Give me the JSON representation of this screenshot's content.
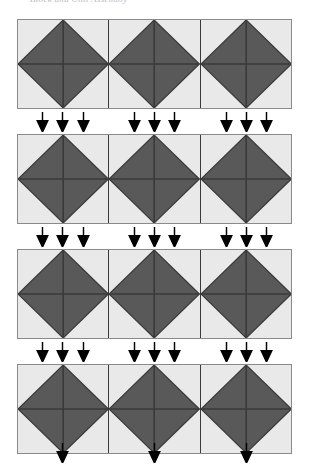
{
  "caption": {
    "text": "Block and Unit Assembly"
  },
  "colors": {
    "page_background": "#ffffff",
    "fabric_light": "#e9e9e9",
    "fabric_dark": "#595959",
    "seam_line": "#3a3a3a",
    "strip_border": "#8a8a8a",
    "arrow": "#000000",
    "caption_text": "#b9b9bf"
  },
  "diagram": {
    "type": "quilt-block-assembly",
    "name": "Broken Dishes / Hourglass strip assembly",
    "rows": 4,
    "blocks_per_row": 3,
    "arrows_per_block": 3,
    "arrow_bands": 4,
    "arrow_direction": "down",
    "block": {
      "shape": "square",
      "interior": "on-point-diamond",
      "triangles": 4,
      "triangle_fill": "dark",
      "corner_fill": "light"
    },
    "strips": [
      {
        "id": "strip-1",
        "label": "Row 1",
        "blocks": [
          {
            "id": "r1-b1",
            "label": "Block 1"
          },
          {
            "id": "r1-b2",
            "label": "Block 2"
          },
          {
            "id": "r1-b3",
            "label": "Block 3"
          }
        ]
      },
      {
        "id": "strip-2",
        "label": "Row 2",
        "blocks": [
          {
            "id": "r2-b1",
            "label": "Block 1"
          },
          {
            "id": "r2-b2",
            "label": "Block 2"
          },
          {
            "id": "r2-b3",
            "label": "Block 3"
          }
        ]
      },
      {
        "id": "strip-3",
        "label": "Row 3",
        "blocks": [
          {
            "id": "r3-b1",
            "label": "Block 1"
          },
          {
            "id": "r3-b2",
            "label": "Block 2"
          },
          {
            "id": "r3-b3",
            "label": "Block 3"
          }
        ]
      },
      {
        "id": "strip-4",
        "label": "Row 4",
        "blocks": [
          {
            "id": "r4-b1",
            "label": "Block 1"
          },
          {
            "id": "r4-b2",
            "label": "Block 2"
          },
          {
            "id": "r4-b3",
            "label": "Block 3"
          }
        ]
      }
    ],
    "bands": [
      {
        "id": "band-1",
        "label": "Join row 1 to row 2"
      },
      {
        "id": "band-2",
        "label": "Join row 2 to row 3"
      },
      {
        "id": "band-3",
        "label": "Join row 3 to row 4"
      },
      {
        "id": "band-4",
        "label": "Join row 4 downward"
      }
    ]
  }
}
